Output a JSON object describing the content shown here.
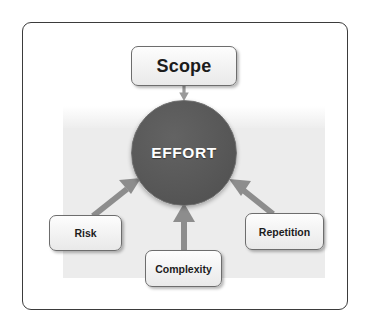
{
  "diagram": {
    "center": {
      "label": "EFFORT",
      "shape": "circle",
      "fill_color": "#585858",
      "text_color": "#ffffff"
    },
    "nodes": [
      {
        "id": "scope",
        "label": "Scope",
        "position": "top"
      },
      {
        "id": "risk",
        "label": "Risk",
        "position": "bottom-left"
      },
      {
        "id": "complexity",
        "label": "Complexity",
        "position": "bottom-center"
      },
      {
        "id": "repetition",
        "label": "Repetition",
        "position": "bottom-right"
      }
    ],
    "arrows": [
      {
        "from": "scope",
        "to": "effort",
        "direction": "down"
      },
      {
        "from": "risk",
        "to": "effort",
        "direction": "up-right"
      },
      {
        "from": "complexity",
        "to": "effort",
        "direction": "up"
      },
      {
        "from": "repetition",
        "to": "effort",
        "direction": "up-left"
      }
    ],
    "colors": {
      "frame_border": "#3b3b3b",
      "panel_background": "#ececec",
      "arrow": "#8a8a8a",
      "box_border": "#6d6d6d",
      "box_fill": "#f4f4f4",
      "circle_fill": "#585858"
    }
  }
}
